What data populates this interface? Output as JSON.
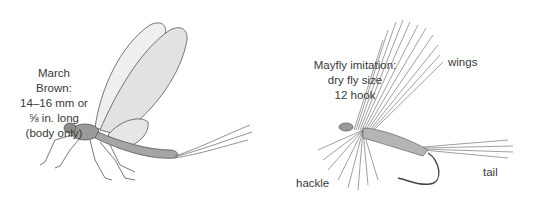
{
  "left_figure": {
    "caption_lines": [
      "March Brown:",
      "14–16 mm or",
      "⅝ in. long",
      "(body only)"
    ],
    "subject": "mayfly-illustration"
  },
  "right_figure": {
    "caption_lines": [
      "Mayfly imitation:",
      "dry fly size",
      "12 hook"
    ],
    "subject": "dry-fly-illustration",
    "callouts": {
      "wings": "wings",
      "hackle": "hackle",
      "tail": "tail"
    }
  }
}
